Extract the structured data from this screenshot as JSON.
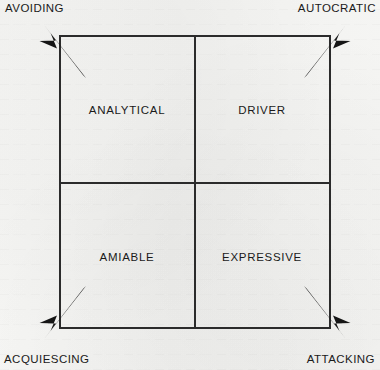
{
  "diagram": {
    "type": "2x2-matrix",
    "background_color": "#f4f4f2",
    "line_color": "#2b2b2b",
    "text_color": "#1a1a1a",
    "quadrants": [
      {
        "id": "top-left",
        "label": "ANALYTICAL"
      },
      {
        "id": "top-right",
        "label": "DRIVER"
      },
      {
        "id": "bottom-left",
        "label": "AMIABLE"
      },
      {
        "id": "bottom-right",
        "label": "EXPRESSIVE"
      }
    ],
    "corner_arrows": [
      {
        "id": "top-left",
        "label": "AVOIDING",
        "direction": "up-left"
      },
      {
        "id": "top-right",
        "label": "AUTOCRATIC",
        "direction": "up-right"
      },
      {
        "id": "bottom-left",
        "label": "ACQUIESCING",
        "direction": "down-left"
      },
      {
        "id": "bottom-right",
        "label": "ATTACKING",
        "direction": "down-right"
      }
    ],
    "labels": {
      "analytical": "ANALYTICAL",
      "driver": "DRIVER",
      "amiable": "AMIABLE",
      "expressive": "EXPRESSIVE",
      "avoiding": "AVOIDING",
      "autocratic": "AUTOCRATIC",
      "acquiescing": "ACQUIESCING",
      "attacking": "ATTACKING"
    }
  }
}
